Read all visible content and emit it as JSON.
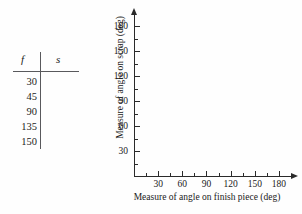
{
  "table": {
    "headers": {
      "col1": "f",
      "col2": "s"
    },
    "rows": [
      {
        "f": "30",
        "s": ""
      },
      {
        "f": "45",
        "s": ""
      },
      {
        "f": "90",
        "s": ""
      },
      {
        "f": "135",
        "s": ""
      },
      {
        "f": "150",
        "s": ""
      }
    ]
  },
  "chart_data": {
    "type": "scatter",
    "title": "",
    "xlabel": "Measure of angle on finish piece (deg)",
    "ylabel": "Measure of angle on scrap (deg)",
    "x": [],
    "values": [],
    "series": [],
    "xlim": [
      0,
      195
    ],
    "ylim": [
      0,
      195
    ],
    "xticks": [
      30,
      60,
      90,
      120,
      150,
      180
    ],
    "yticks": [
      30,
      60,
      90,
      120,
      150,
      180
    ],
    "xtick_labels": [
      "30",
      "60",
      "90",
      "120",
      "150",
      "180"
    ],
    "ytick_labels": [
      "30",
      "60",
      "90",
      "120",
      "150",
      "180"
    ],
    "minor_tick_step": 15,
    "grid": false,
    "legend": false,
    "axis_color": "#2a2a2a",
    "background": "#fefefe"
  }
}
